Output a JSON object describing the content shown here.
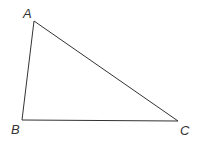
{
  "diagram": {
    "type": "triangle",
    "stroke_color": "#333333",
    "vertices": [
      {
        "label": "A",
        "x": 34,
        "y": 21,
        "label_x": 23,
        "label_y": 18
      },
      {
        "label": "B",
        "x": 22,
        "y": 120,
        "label_x": 11,
        "label_y": 134
      },
      {
        "label": "C",
        "x": 178,
        "y": 121,
        "label_x": 180,
        "label_y": 135
      }
    ]
  }
}
